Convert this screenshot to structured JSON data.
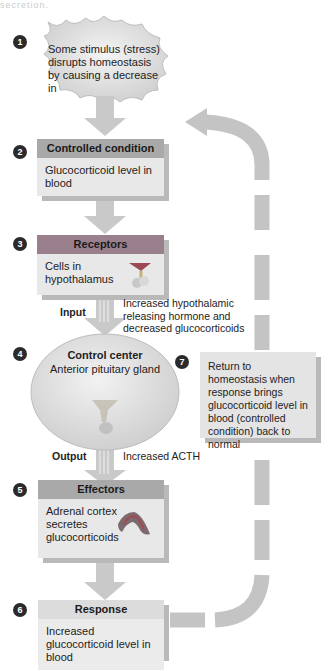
{
  "header_cut_text": "secretion.",
  "steps": [
    {
      "number": "1",
      "text": "Some stimulus (stress) disrupts homeostasis by causing a decrease in"
    },
    {
      "number": "2",
      "title": "Controlled condition",
      "text": "Glucocorticoid level in blood"
    },
    {
      "number": "3",
      "title": "Receptors",
      "text": "Cells in hypothalamus"
    },
    {
      "number": "4",
      "title": "Control center",
      "text": "Anterior pituitary gland"
    },
    {
      "number": "5",
      "title": "Effectors",
      "text": "Adrenal cortex secretes glucocorticoids"
    },
    {
      "number": "6",
      "title": "Response",
      "text": "Increased glucocorticoid level in blood"
    },
    {
      "number": "7",
      "text": "Return to homeostasis when response brings glucocorticoid level in blood (controlled condition) back to normal"
    }
  ],
  "labels": {
    "input": "Input",
    "input_desc": "Increased hypothalamic releasing hormone and decreased glucocorticoids",
    "output": "Output",
    "output_desc": "Increased ACTH"
  },
  "colors": {
    "arrow": "#c8c8c8",
    "box": "#e8e8e8",
    "receptors_header": "#9a7f8c",
    "controlled_header": "#a9a9a9",
    "loop": "#c4c4c4"
  }
}
